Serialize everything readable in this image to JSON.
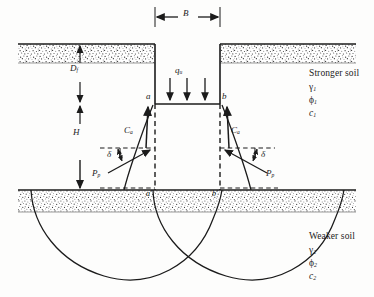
{
  "figure": {
    "name": "bearing-capacity-foundation-on-layered-soil"
  },
  "dimensions": {
    "width_label": "B",
    "depth_label": "D",
    "depth_sub": "f",
    "thickness_label": "H"
  },
  "load": {
    "symbol": "q",
    "subscript": "u"
  },
  "points": {
    "top_left": "a",
    "top_right": "b",
    "bottom_left": "a′",
    "bottom_right": "b′"
  },
  "forces": {
    "adhesion_symbol": "C",
    "adhesion_sub": "a",
    "passive_symbol": "P",
    "passive_sub": "p",
    "angle_symbol": "δ"
  },
  "upper_soil": {
    "title": "Stronger soil",
    "unit_weight": "γ",
    "unit_weight_sub": "1",
    "friction_angle": "ϕ",
    "friction_angle_sub": "1",
    "cohesion": "c",
    "cohesion_sub": "1"
  },
  "lower_soil": {
    "title": "Weaker soil",
    "unit_weight": "γ",
    "unit_weight_sub": "2",
    "friction_angle": "ϕ",
    "friction_angle_sub": "2",
    "cohesion": "c",
    "cohesion_sub": "2"
  },
  "colors": {
    "ink": "#1b1b1b",
    "line": "#2a2a2a",
    "stipple": "#3a3a3a",
    "background": "#fdfdfc"
  }
}
